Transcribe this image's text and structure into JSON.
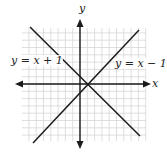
{
  "chart_data": {
    "type": "line",
    "title": "",
    "xlabel": "x",
    "ylabel": "y",
    "xlim": [
      -8,
      9
    ],
    "ylim": [
      -8,
      8
    ],
    "grid": true,
    "legend": "inline labels",
    "series": [
      {
        "name": "y = x + 1",
        "label_position": "upper-left",
        "x": [
          -7,
          9
        ],
        "y": [
          8,
          -8
        ],
        "direction": "descending"
      },
      {
        "name": "y = x − 1",
        "label_position": "upper-right",
        "x": [
          -7,
          9
        ],
        "y": [
          -8,
          8
        ],
        "direction": "ascending"
      }
    ],
    "intersection": {
      "x": 1,
      "y": 0
    },
    "annotations": [
      "y = x + 1",
      "y = x − 1"
    ]
  },
  "axes": {
    "x_label": "x",
    "y_label": "y"
  },
  "labels": {
    "line1": "y = x + 1",
    "line2": "y = x − 1"
  },
  "colors": {
    "axis": "#1a1a1a",
    "line": "#1a1a1a",
    "grid": "#d4d4d4",
    "background": "#ffffff"
  }
}
